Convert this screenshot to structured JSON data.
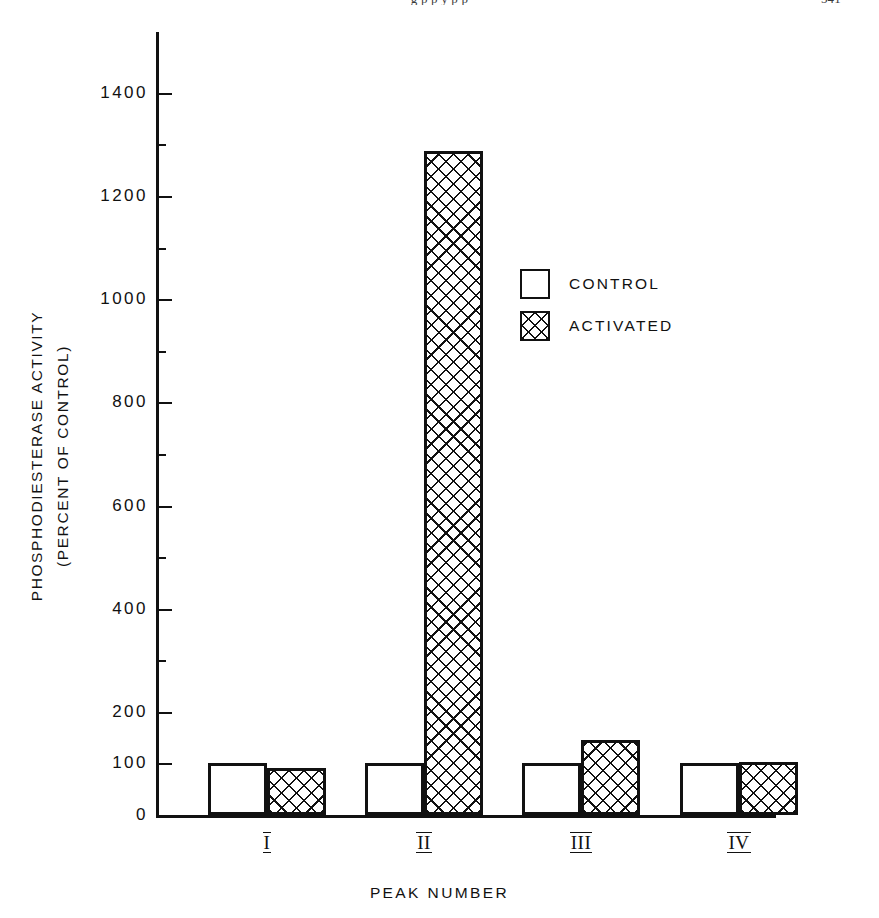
{
  "running_head": {
    "text": "g   p  p           y   p  p",
    "page_number": "541"
  },
  "chart_data": {
    "type": "bar",
    "title": "",
    "subtitle": "",
    "xlabel": "PEAK NUMBER",
    "ylabel": "PHOSPHODIESTERASE ACTIVITY",
    "ylabel_line2": "(PERCENT OF CONTROL)",
    "categories": [
      "I",
      "II",
      "III",
      "IV"
    ],
    "series": [
      {
        "name": "CONTROL",
        "values": [
          100,
          100,
          100,
          100
        ]
      },
      {
        "name": "ACTIVATED",
        "values": [
          92,
          1287,
          145,
          103
        ]
      }
    ],
    "ylim": [
      0,
      1520
    ],
    "yticks": [
      0,
      100,
      200,
      400,
      600,
      800,
      1000,
      1200,
      1400
    ],
    "ytick_labels": [
      "0",
      "100",
      "200",
      "400",
      "600",
      "800",
      "1000",
      "1200",
      "1400"
    ],
    "minor_yticks": [
      300,
      500,
      700,
      900,
      1100,
      1300
    ],
    "grid": false,
    "legend_position": "upper-right-inside",
    "colors": {
      "control_fill": "#ffffff",
      "activated_fill": "#ffffff",
      "hatch": "#111111",
      "axis": "#111111",
      "text": "#111111"
    }
  },
  "legend": {
    "entries": [
      {
        "label": "CONTROL",
        "swatch": "open-square-swatch"
      },
      {
        "label": "ACTIVATED",
        "swatch": "crosshatch-square-swatch"
      }
    ]
  }
}
